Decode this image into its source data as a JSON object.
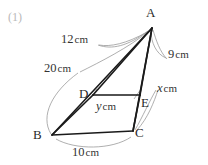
{
  "problem": {
    "number": "(1)"
  },
  "figure": {
    "type": "oblique-prism-diagram",
    "vertices": [
      {
        "id": "A",
        "label": "A",
        "x": 152,
        "y": 28
      },
      {
        "id": "B",
        "label": "B",
        "x": 52,
        "y": 135
      },
      {
        "id": "C",
        "label": "C",
        "x": 133,
        "y": 131
      },
      {
        "id": "D",
        "label": "D",
        "x": 93,
        "y": 95
      },
      {
        "id": "E",
        "label": "E",
        "x": 140,
        "y": 95
      }
    ],
    "edges": [
      {
        "from": "A",
        "to": "D"
      },
      {
        "from": "A",
        "to": "E"
      },
      {
        "from": "A",
        "to": "C"
      },
      {
        "from": "A",
        "to": "B"
      },
      {
        "from": "D",
        "to": "E"
      },
      {
        "from": "D",
        "to": "B"
      },
      {
        "from": "B",
        "to": "C"
      },
      {
        "from": "C",
        "to": "E"
      }
    ],
    "dimensions": [
      {
        "id": "ad",
        "value": "12",
        "unit": "cm",
        "text": "12",
        "variable": false
      },
      {
        "id": "ab",
        "value": "20",
        "unit": "cm",
        "text": "20",
        "variable": false
      },
      {
        "id": "ae",
        "value": "9",
        "unit": "cm",
        "text": "9",
        "variable": false
      },
      {
        "id": "ec",
        "value": "x",
        "unit": "cm",
        "text": "x",
        "variable": true
      },
      {
        "id": "de",
        "value": "y",
        "unit": "cm",
        "text": "y",
        "variable": true
      },
      {
        "id": "bc",
        "value": "10",
        "unit": "cm",
        "text": "10",
        "variable": false
      }
    ],
    "colors": {
      "edge": "#1a1a1a",
      "leader": "#9a9a9a",
      "text": "#2a2a2a",
      "problem_number": "#b9b9b9",
      "background": "#ffffff"
    }
  }
}
